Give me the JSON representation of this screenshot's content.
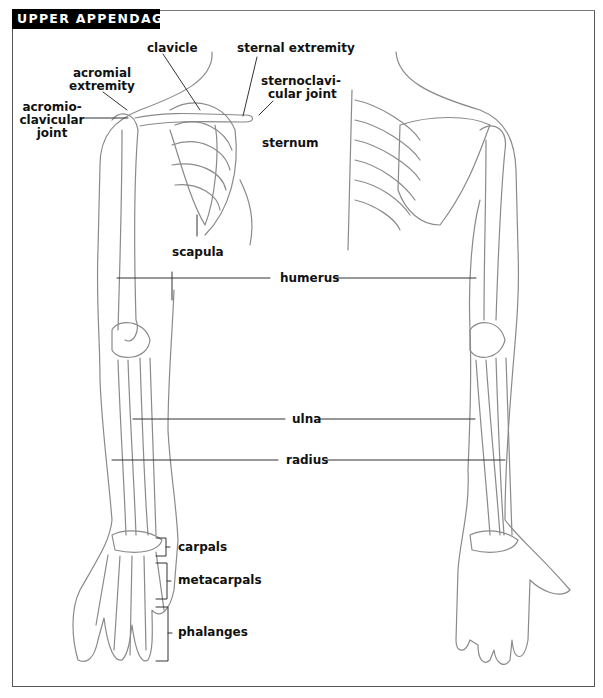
{
  "title": "UPPER APPENDAGES",
  "labels": {
    "clavicle": "clavicle",
    "sternal_extremity": "sternal extremity",
    "acromial_extremity_1": "acromial",
    "acromial_extremity_2": "extremity",
    "acromioclavicular_1": "acromio-",
    "acromioclavicular_2": "clavicular",
    "acromioclavicular_3": "joint",
    "sternoclavicular_1": "sternoclavi-",
    "sternoclavicular_2": "cular joint",
    "sternum": "sternum",
    "scapula": "scapula",
    "humerus": "humerus",
    "ulna": "ulna",
    "radius": "radius",
    "carpals": "carpals",
    "metacarpals": "metacarpals",
    "phalanges": "phalanges"
  },
  "colors": {
    "title_bg": "#000000",
    "title_fg": "#ffffff",
    "line": "#333333",
    "bone": "#888888"
  }
}
